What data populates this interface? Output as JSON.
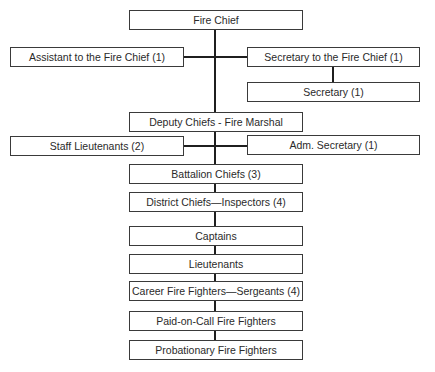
{
  "chart": {
    "nodes": {
      "fire_chief": "Fire Chief",
      "assistant": "Assistant to the Fire Chief (1)",
      "secretary_to_chief": "Secretary to the Fire Chief (1)",
      "secretary": "Secretary (1)",
      "deputy_chiefs": "Deputy Chiefs - Fire Marshal",
      "staff_lieutenants": "Staff Lieutenants (2)",
      "adm_secretary": "Adm. Secretary (1)",
      "battalion_chiefs": "Battalion Chiefs (3)",
      "district_chiefs": "District Chiefs—Inspectors (4)",
      "captains": "Captains",
      "lieutenants": "Lieutenants",
      "career_fire_fighters": "Career Fire Fighters—Sergeants (4)",
      "paid_on_call": "Paid-on-Call Fire Fighters",
      "probationary": "Probationary Fire Fighters"
    },
    "edges": [
      [
        "fire_chief",
        "assistant"
      ],
      [
        "fire_chief",
        "secretary_to_chief"
      ],
      [
        "secretary_to_chief",
        "secretary"
      ],
      [
        "fire_chief",
        "deputy_chiefs"
      ],
      [
        "deputy_chiefs",
        "staff_lieutenants"
      ],
      [
        "deputy_chiefs",
        "adm_secretary"
      ],
      [
        "deputy_chiefs",
        "battalion_chiefs"
      ],
      [
        "battalion_chiefs",
        "district_chiefs"
      ],
      [
        "district_chiefs",
        "captains"
      ],
      [
        "captains",
        "lieutenants"
      ],
      [
        "lieutenants",
        "career_fire_fighters"
      ],
      [
        "career_fire_fighters",
        "paid_on_call"
      ],
      [
        "paid_on_call",
        "probationary"
      ]
    ]
  }
}
